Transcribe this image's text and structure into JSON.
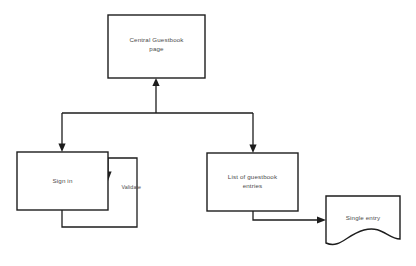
{
  "diagram": {
    "background_color": "#ffffff",
    "line_color": "#1d1d1d",
    "text_color": "#4a4a4a",
    "nodes": [
      {
        "id": "central",
        "label_line1": "Central Guestbook",
        "label_line2": "page",
        "shape": "rectangle"
      },
      {
        "id": "signin",
        "label_line1": "Sign in",
        "label_line2": "",
        "shape": "rectangle"
      },
      {
        "id": "list",
        "label_line1": "List of guestbook",
        "label_line2": "entries",
        "shape": "rectangle"
      },
      {
        "id": "single",
        "label_line1": "Single entry",
        "label_line2": "",
        "shape": "document"
      }
    ],
    "edge_labels": [
      {
        "id": "validate",
        "label": "Validate"
      }
    ]
  }
}
